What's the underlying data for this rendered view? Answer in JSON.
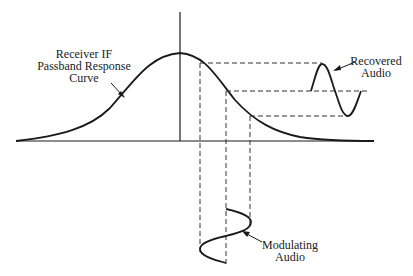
{
  "diagram": {
    "labels": {
      "passband_line1": "Receiver IF",
      "passband_line2": "Passband Response",
      "passband_line3": "Curve",
      "recovered_line1": "Recovered",
      "recovered_line2": "Audio",
      "modulating_line1": "Modulating",
      "modulating_line2": "Audio"
    },
    "colors": {
      "ink": "#1a1a1a",
      "background": "#ffffff"
    }
  }
}
